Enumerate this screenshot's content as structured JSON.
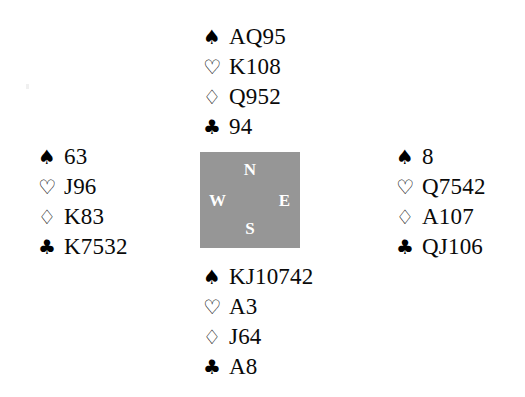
{
  "diagram": {
    "type": "bridge-hand-diagram",
    "background_color": "#ffffff",
    "text_color": "#0a0a0a"
  },
  "suits": {
    "spade": {
      "name": "spade-suit-symbol",
      "glyph": "♠",
      "filled": true
    },
    "heart": {
      "name": "heart-suit-symbol",
      "glyph": "♡",
      "filled": false
    },
    "diamond": {
      "name": "diamond-suit-symbol",
      "glyph": "♢",
      "filled": false
    },
    "club": {
      "name": "club-suit-symbol",
      "glyph": "♣",
      "filled": true
    }
  },
  "compass": {
    "background_color": "#969696",
    "label_color": "#ffffff",
    "north": "N",
    "west": "W",
    "east": "E",
    "south": "S"
  },
  "hands": {
    "north": {
      "position": "North",
      "spades": "AQ95",
      "hearts": "K108",
      "diamonds": "Q952",
      "clubs": "94"
    },
    "west": {
      "position": "West",
      "spades": "63",
      "hearts": "J96",
      "diamonds": "K83",
      "clubs": "K7532"
    },
    "east": {
      "position": "East",
      "spades": "8",
      "hearts": "Q7542",
      "diamonds": "A107",
      "clubs": "QJ106"
    },
    "south": {
      "position": "South",
      "spades": "KJ10742",
      "hearts": "A3",
      "diamonds": "J64",
      "clubs": "A8"
    }
  }
}
